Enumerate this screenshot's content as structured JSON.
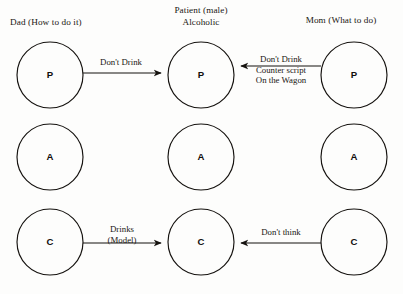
{
  "diagram": {
    "background_color": "#fdfdfc",
    "ink_color": "#15120f",
    "columns": [
      {
        "key": "dad",
        "header": "Dad (How to do it)",
        "nodes": [
          {
            "key": "dad-p",
            "label": "P",
            "name": "parent"
          },
          {
            "key": "dad-a",
            "label": "A",
            "name": "adult"
          },
          {
            "key": "dad-c",
            "label": "C",
            "name": "child"
          }
        ]
      },
      {
        "key": "patient",
        "header": "Patient (male)\nAlcoholic",
        "nodes": [
          {
            "key": "patient-p",
            "label": "P",
            "name": "parent"
          },
          {
            "key": "patient-a",
            "label": "A",
            "name": "adult"
          },
          {
            "key": "patient-c",
            "label": "C",
            "name": "child"
          }
        ]
      },
      {
        "key": "mom",
        "header": "Mom (What to do)",
        "nodes": [
          {
            "key": "mom-p",
            "label": "P",
            "name": "parent"
          },
          {
            "key": "mom-a",
            "label": "A",
            "name": "adult"
          },
          {
            "key": "mom-c",
            "label": "C",
            "name": "child"
          }
        ]
      }
    ],
    "arrows": [
      {
        "key": "dad-p-to-patient-p",
        "from": "dad-p",
        "to": "patient-p",
        "direction": "right",
        "label": "Don't Drink"
      },
      {
        "key": "mom-p-to-patient-p",
        "from": "mom-p",
        "to": "patient-p",
        "direction": "left",
        "label": "Don't Drink\nCounter script\nOn the Wagon"
      },
      {
        "key": "dad-c-to-patient-c",
        "from": "dad-c",
        "to": "patient-c",
        "direction": "right",
        "label": "Drinks\n(Model)"
      },
      {
        "key": "mom-c-to-patient-c",
        "from": "mom-c",
        "to": "patient-c",
        "direction": "left",
        "label": "Don't think"
      }
    ]
  }
}
